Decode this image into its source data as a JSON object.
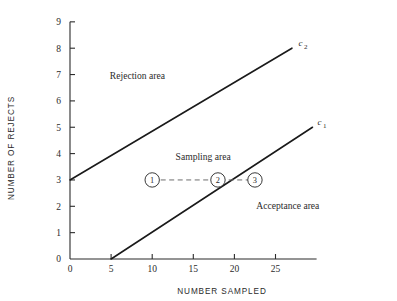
{
  "chart_data": {
    "type": "line",
    "title": "",
    "xlabel": "NUMBER SAMPLED",
    "ylabel": "NUMBER OF REJECTS",
    "xlim": [
      0,
      30
    ],
    "ylim": [
      0,
      9
    ],
    "xticks": [
      0,
      5,
      10,
      15,
      20,
      25
    ],
    "yticks": [
      0,
      1,
      2,
      3,
      4,
      5,
      6,
      7,
      8,
      9
    ],
    "xtick_labels": [
      "0",
      "5",
      "10",
      "15",
      "20",
      "25"
    ],
    "ytick_labels": [
      "0",
      "1",
      "2",
      "3",
      "4",
      "5",
      "6",
      "7",
      "8",
      "9"
    ],
    "grid": false,
    "legend": "none",
    "series": [
      {
        "name": "c2",
        "label": "c",
        "label_sub": "2",
        "style": "solid",
        "x": [
          0,
          27
        ],
        "y": [
          3,
          8
        ],
        "label_x": 27.8,
        "label_y": 8.1
      },
      {
        "name": "c1",
        "label": "c",
        "label_sub": "1",
        "style": "solid",
        "x": [
          5,
          29.5
        ],
        "y": [
          0,
          5
        ],
        "label_x": 30.1,
        "label_y": 5.1
      },
      {
        "name": "sampling-path",
        "label": "",
        "label_sub": "",
        "style": "dashed",
        "x": [
          10,
          18,
          22.5
        ],
        "y": [
          3,
          3,
          3
        ],
        "label_x": 0,
        "label_y": 0
      }
    ],
    "markers": [
      {
        "label": "1",
        "x": 10,
        "y": 3
      },
      {
        "label": "2",
        "x": 18,
        "y": 3
      },
      {
        "label": "3",
        "x": 22.5,
        "y": 3
      }
    ],
    "annotations": [
      {
        "text": "Rejection area",
        "x": 8.2,
        "y": 6.85
      },
      {
        "text": "Sampling area",
        "x": 16.2,
        "y": 3.75
      },
      {
        "text": "Acceptance area",
        "x": 26.5,
        "y": 1.9
      }
    ]
  }
}
